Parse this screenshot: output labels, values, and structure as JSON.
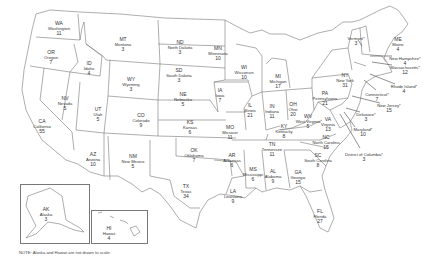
{
  "map": {
    "title": "Electoral votes by state",
    "line_color": "#777777",
    "background": "#ffffff"
  },
  "states": [
    {
      "abbr": "WA",
      "name": "Washington",
      "votes": "11",
      "x": 59,
      "y": 21
    },
    {
      "abbr": "OR",
      "name": "Oregon",
      "votes": "7",
      "x": 51,
      "y": 50
    },
    {
      "abbr": "ID",
      "name": "Idaho",
      "votes": "4",
      "x": 89,
      "y": 61
    },
    {
      "abbr": "MT",
      "name": "Montana",
      "votes": "3",
      "x": 123,
      "y": 37
    },
    {
      "abbr": "WY",
      "name": "Wyoming",
      "votes": "3",
      "x": 131,
      "y": 77
    },
    {
      "abbr": "ND",
      "name": "North Dakota",
      "votes": "3",
      "x": 180,
      "y": 40
    },
    {
      "abbr": "SD",
      "name": "South Dakota",
      "votes": "3",
      "x": 179,
      "y": 68
    },
    {
      "abbr": "MN",
      "name": "Minnesota",
      "votes": "10",
      "x": 218,
      "y": 46
    },
    {
      "abbr": "NV",
      "name": "Nevada",
      "votes": "5",
      "x": 65,
      "y": 96
    },
    {
      "abbr": "CA",
      "name": "California",
      "votes": "55",
      "x": 42,
      "y": 119
    },
    {
      "abbr": "UT",
      "name": "Utah",
      "votes": "5",
      "x": 98,
      "y": 107
    },
    {
      "abbr": "AZ",
      "name": "Arizona",
      "votes": "10",
      "x": 93,
      "y": 152
    },
    {
      "abbr": "CO",
      "name": "Colorado",
      "votes": "9",
      "x": 141,
      "y": 113
    },
    {
      "abbr": "NM",
      "name": "New Mexico",
      "votes": "5",
      "x": 133,
      "y": 154
    },
    {
      "abbr": "NE",
      "name": "Nebraska",
      "votes": "5",
      "x": 183,
      "y": 92
    },
    {
      "abbr": "KS",
      "name": "Kansas",
      "votes": "6",
      "x": 190,
      "y": 120
    },
    {
      "abbr": "OK",
      "name": "Oklahoma",
      "votes": "7",
      "x": 194,
      "y": 148
    },
    {
      "abbr": "TX",
      "name": "Texas",
      "votes": "34",
      "x": 186,
      "y": 184
    },
    {
      "abbr": "IA",
      "name": "Iowa",
      "votes": "7",
      "x": 220,
      "y": 88
    },
    {
      "abbr": "MO",
      "name": "Missouri",
      "votes": "11",
      "x": 230,
      "y": 125
    },
    {
      "abbr": "AR",
      "name": "Arkansas",
      "votes": "6",
      "x": 232,
      "y": 153
    },
    {
      "abbr": "LA",
      "name": "Louisiana",
      "votes": "9",
      "x": 233,
      "y": 189
    },
    {
      "abbr": "MS",
      "name": "Mississippi",
      "votes": "6",
      "x": 253,
      "y": 167
    },
    {
      "abbr": "AL",
      "name": "Alabama",
      "votes": "9",
      "x": 273,
      "y": 169
    },
    {
      "abbr": "WI",
      "name": "Wisconsin",
      "votes": "10",
      "x": 244,
      "y": 65
    },
    {
      "abbr": "IL",
      "name": "Illinois",
      "votes": "21",
      "x": 250,
      "y": 103
    },
    {
      "abbr": "MI",
      "name": "Michigan",
      "votes": "17",
      "x": 278,
      "y": 74
    },
    {
      "abbr": "IN",
      "name": "Indiana",
      "votes": "11",
      "x": 272,
      "y": 104
    },
    {
      "abbr": "OH",
      "name": "Ohio",
      "votes": "20",
      "x": 293,
      "y": 102
    },
    {
      "abbr": "KY",
      "name": "Kentucky",
      "votes": "8",
      "x": 284,
      "y": 124
    },
    {
      "abbr": "TN",
      "name": "Tennessee",
      "votes": "11",
      "x": 272,
      "y": 142
    },
    {
      "abbr": "GA",
      "name": "Georgia",
      "votes": "15",
      "x": 298,
      "y": 170
    },
    {
      "abbr": "FL",
      "name": "Florida",
      "votes": "27",
      "x": 320,
      "y": 209
    },
    {
      "abbr": "SC",
      "name": "South Carolina",
      "votes": "8",
      "x": 318,
      "y": 153
    },
    {
      "abbr": "NC",
      "name": "North Carolina",
      "votes": "15",
      "x": 326,
      "y": 135
    },
    {
      "abbr": "VA",
      "name": "Virginia",
      "votes": "13",
      "x": 328,
      "y": 117
    },
    {
      "abbr": "WV",
      "name": "West Virginia",
      "votes": "5",
      "x": 308,
      "y": 114
    },
    {
      "abbr": "PA",
      "name": "Pennsylvania",
      "votes": "21",
      "x": 325,
      "y": 91
    },
    {
      "abbr": "NY",
      "name": "New York",
      "votes": "31",
      "x": 345,
      "y": 73
    },
    {
      "abbr": "ME",
      "name": "Maine",
      "votes": "4",
      "x": 398,
      "y": 37
    }
  ],
  "callouts": [
    {
      "abbr": "VT",
      "name": "Vermont",
      "votes": "3",
      "label": "Vermont*",
      "lx": 356,
      "ly": 36
    },
    {
      "abbr": "NH",
      "name": "New Hampshire",
      "votes": "4",
      "label": "New Hampshire*",
      "lx": 405,
      "ly": 56
    },
    {
      "abbr": "MA",
      "name": "Massachusetts",
      "votes": "12",
      "label": "Massachusetts*",
      "lx": 405,
      "ly": 65
    },
    {
      "abbr": "RI",
      "name": "Rhode Island",
      "votes": "4",
      "label": "Rhode Island*",
      "lx": 404,
      "ly": 84
    },
    {
      "abbr": "CT",
      "name": "Connecticut",
      "votes": "7",
      "label": "Connecticut*",
      "lx": 377,
      "ly": 92
    },
    {
      "abbr": "NJ",
      "name": "New Jersey",
      "votes": "15",
      "label": "New Jersey*",
      "lx": 389,
      "ly": 103
    },
    {
      "abbr": "DE",
      "name": "Delaware",
      "votes": "3",
      "label": "Delaware*",
      "lx": 366,
      "ly": 112
    },
    {
      "abbr": "MD",
      "name": "Maryland",
      "votes": "10",
      "label": "Maryland*",
      "lx": 363,
      "ly": 127
    },
    {
      "abbr": "DC",
      "name": "District of Columbia",
      "votes": "3",
      "label": "District of Columbia*",
      "lx": 364,
      "ly": 152
    }
  ],
  "insets": [
    {
      "abbr": "AK",
      "name": "Alaska",
      "votes": "3",
      "x": 46,
      "y": 207
    },
    {
      "abbr": "HI",
      "name": "Hawaii",
      "votes": "4",
      "x": 109,
      "y": 226
    }
  ],
  "note": "NOTE: Alaska and Hawaii are not drawn to scale."
}
